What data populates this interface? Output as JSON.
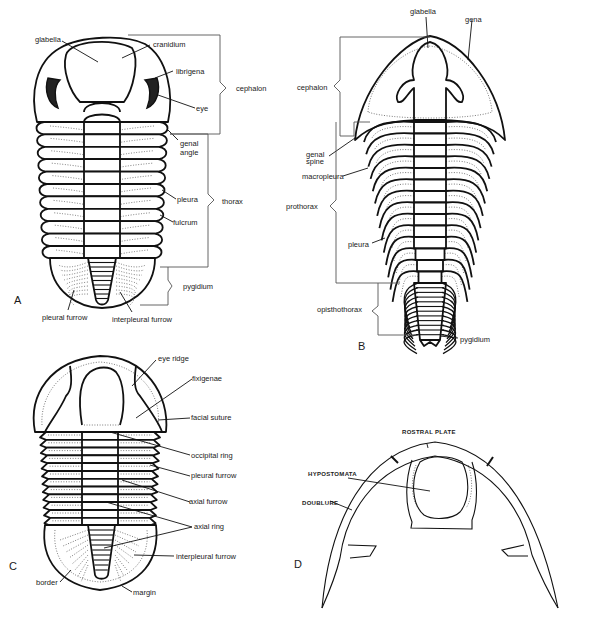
{
  "figure": {
    "panels": [
      {
        "id": "A",
        "letter": "A",
        "labels": {
          "glabella": "glabella",
          "cranidium": "cranidium",
          "librigena": "librigena",
          "eye": "eye",
          "genal_angle_1": "genal",
          "genal_angle_2": "angle",
          "cephalon": "cephalon",
          "pleura": "pleura",
          "fulcrum": "fulcrum",
          "thorax": "thorax",
          "pygidium": "pygidium",
          "pleural_furrow": "pleural furrow",
          "interpleural_furrow": "interpleural furrow"
        }
      },
      {
        "id": "B",
        "letter": "B",
        "labels": {
          "glabella": "glabella",
          "gena": "gena",
          "cephalon": "cephalon",
          "genal_spine_1": "genal",
          "genal_spine_2": "spine",
          "macropleura": "macropleura",
          "prothorax": "prothorax",
          "pleura": "pleura",
          "opisthothorax": "opisthothorax",
          "pygidium": "pygidium"
        }
      },
      {
        "id": "C",
        "letter": "C",
        "labels": {
          "eye_ridge": "eye ridge",
          "fixigenae": "fixigenae",
          "facial_suture": "facial suture",
          "occipital_ring": "occipital ring",
          "pleural_furrow": "pleural furrow",
          "axial_furrow": "axial furrow",
          "axial_ring": "axial ring",
          "interpleural_furrow": "interpleural furrow",
          "border": "border",
          "margin": "margin"
        }
      },
      {
        "id": "D",
        "letter": "D",
        "labels": {
          "rostral_plate": "ROSTRAL PLATE",
          "hypostomata": "HYPOSTOMATA",
          "doublure": "DOUBLURE"
        }
      }
    ]
  }
}
